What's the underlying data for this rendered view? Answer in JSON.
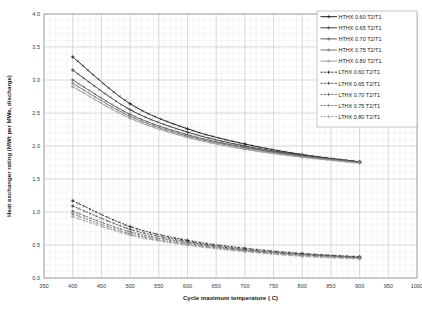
{
  "chart_data": {
    "type": "line",
    "title": "",
    "xlabel": "Cycle maximum temperature ( C)",
    "ylabel": "Heat exchanger rating (MWt per MWe, discharge)",
    "xlim": [
      350,
      1000
    ],
    "ylim": [
      0.0,
      4.0
    ],
    "xticks": [
      350,
      400,
      450,
      500,
      550,
      600,
      650,
      700,
      750,
      800,
      850,
      900,
      950,
      1000
    ],
    "yticks": [
      "0.0",
      "0.5",
      "1.0",
      "1.5",
      "2.0",
      "2.5",
      "3.0",
      "3.5",
      "4.0"
    ],
    "grid": true,
    "minor_grid": true,
    "legend_position": "top-right",
    "x": [
      400,
      500,
      600,
      700,
      800,
      900
    ],
    "series": [
      {
        "name": "HTHX 0.60 T2/T1",
        "group": "HTHX",
        "ratio": "0.60",
        "dash": "solid",
        "color": "#1a1a1a",
        "values": [
          3.35,
          2.64,
          2.26,
          2.03,
          1.87,
          1.76
        ]
      },
      {
        "name": "HTHX 0.65 T2/T1",
        "group": "HTHX",
        "ratio": "0.65",
        "dash": "solid",
        "color": "#3d3d3d",
        "values": [
          3.15,
          2.55,
          2.21,
          2.0,
          1.86,
          1.76
        ]
      },
      {
        "name": "HTHX 0.70 T2/T1",
        "group": "HTHX",
        "ratio": "0.70",
        "dash": "solid",
        "color": "#5c5c5c",
        "values": [
          3.0,
          2.48,
          2.17,
          1.98,
          1.85,
          1.75
        ]
      },
      {
        "name": "HTHX 0.75 T2/T1",
        "group": "HTHX",
        "ratio": "0.75",
        "dash": "solid",
        "color": "#787878",
        "values": [
          2.95,
          2.45,
          2.15,
          1.97,
          1.84,
          1.75
        ]
      },
      {
        "name": "HTHX 0.80 T2/T1",
        "group": "HTHX",
        "ratio": "0.80",
        "dash": "solid",
        "color": "#9a9a9a",
        "values": [
          2.9,
          2.42,
          2.13,
          1.95,
          1.83,
          1.74
        ]
      },
      {
        "name": "LTHX 0.60 T2/T1",
        "group": "LTHX",
        "ratio": "0.60",
        "dash": "dashed",
        "color": "#1a1a1a",
        "values": [
          1.17,
          0.78,
          0.57,
          0.45,
          0.37,
          0.32
        ]
      },
      {
        "name": "LTHX 0.65 T2/T1",
        "group": "LTHX",
        "ratio": "0.65",
        "dash": "dashed",
        "color": "#3d3d3d",
        "values": [
          1.09,
          0.74,
          0.55,
          0.43,
          0.36,
          0.31
        ]
      },
      {
        "name": "LTHX 0.70 T2/T1",
        "group": "LTHX",
        "ratio": "0.70",
        "dash": "dashed",
        "color": "#5c5c5c",
        "values": [
          1.01,
          0.7,
          0.53,
          0.42,
          0.35,
          0.31
        ]
      },
      {
        "name": "LTHX 0.75 T2/T1",
        "group": "LTHX",
        "ratio": "0.75",
        "dash": "dashed",
        "color": "#787878",
        "values": [
          0.97,
          0.67,
          0.51,
          0.41,
          0.34,
          0.3
        ]
      },
      {
        "name": "LTHX 0.80 T2/T1",
        "group": "LTHX",
        "ratio": "0.80",
        "dash": "dashed",
        "color": "#9a9a9a",
        "values": [
          0.93,
          0.65,
          0.5,
          0.4,
          0.33,
          0.29
        ]
      }
    ]
  },
  "legend": {
    "items": [
      {
        "label": "HTHX 0.60 T2/T1"
      },
      {
        "label": "HTHX 0.65 T2/T1"
      },
      {
        "label": "HTHX 0.70 T2/T1"
      },
      {
        "label": "HTHX 0.75 T2/T1"
      },
      {
        "label": "HTHX 0.80 T2/T1"
      },
      {
        "label": "LTHX 0.60 T2/T1"
      },
      {
        "label": "LTHX 0.65 T2/T1"
      },
      {
        "label": "LTHX 0.70 T2/T1"
      },
      {
        "label": "LTHX 0.75 T2/T1"
      },
      {
        "label": "LTHX 0.80 T2/T1"
      }
    ]
  },
  "caption": {
    "text": ""
  }
}
